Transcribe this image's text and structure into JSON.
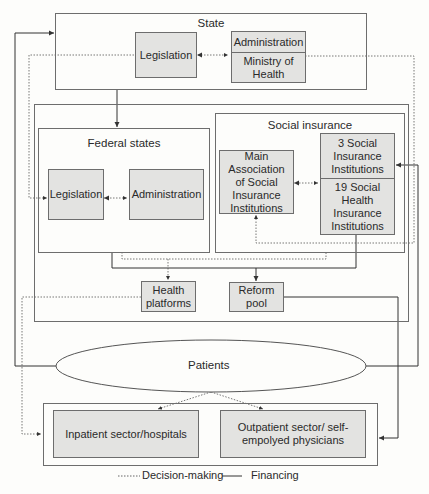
{
  "state": {
    "title": "State",
    "legislation": "Legislation",
    "administration": "Administration",
    "ministry": "Ministry of Health"
  },
  "federal": {
    "title": "Federal states",
    "legislation": "Legislation",
    "administration": "Administration"
  },
  "social": {
    "title": "Social insurance",
    "main_association": "Main Association of Social Insurance Institutions",
    "three_social": "3 Social Insurance Institutions",
    "nineteen_health": "19 Social Health Insurance Institutions"
  },
  "health_platforms": "Health platforms",
  "reform_pool": "Reform pool",
  "patients": "Patients",
  "inpatient": "Inpatient sector/hospitals",
  "outpatient": "Outpatient sector/ self-empolyed physicians",
  "legend": {
    "decision": "Decision-making",
    "financing": "Financing"
  },
  "colors": {
    "box_fill": "#e3e3e1",
    "line": "#333333",
    "border": "#6d6d6d"
  }
}
